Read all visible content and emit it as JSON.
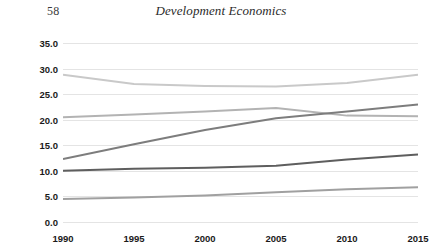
{
  "header": {
    "page_number": "58",
    "running_title": "Development Economics"
  },
  "chart_data": {
    "type": "line",
    "title": "",
    "xlabel": "",
    "ylabel": "",
    "x": [
      1990,
      1995,
      2000,
      2005,
      2010,
      2015
    ],
    "categories": [
      "1990",
      "1995",
      "2000",
      "2005",
      "2010",
      "2015"
    ],
    "ylim": [
      0.0,
      35.0
    ],
    "ytick_labels": [
      "0.0",
      "5.0",
      "10.0",
      "15.0",
      "20.0",
      "25.0",
      "30.0",
      "35.0"
    ],
    "ytick_values": [
      0.0,
      5.0,
      10.0,
      15.0,
      20.0,
      25.0,
      30.0,
      35.0
    ],
    "grid": true,
    "legend": "none",
    "series": [
      {
        "name": "series-1",
        "color": "#c9c9c9",
        "values": [
          28.8,
          27.0,
          26.6,
          26.5,
          27.2,
          28.8
        ]
      },
      {
        "name": "series-2",
        "color": "#b3b3b3",
        "values": [
          20.5,
          21.0,
          21.6,
          22.3,
          20.8,
          20.7
        ]
      },
      {
        "name": "series-3",
        "color": "#7d7d7d",
        "values": [
          12.3,
          15.2,
          18.0,
          20.3,
          21.6,
          23.0
        ]
      },
      {
        "name": "series-4",
        "color": "#5e5e5e",
        "values": [
          10.0,
          10.4,
          10.6,
          11.0,
          12.2,
          13.2
        ]
      },
      {
        "name": "series-5",
        "color": "#a0a0a0",
        "values": [
          4.5,
          4.8,
          5.2,
          5.8,
          6.4,
          6.8
        ]
      }
    ]
  }
}
